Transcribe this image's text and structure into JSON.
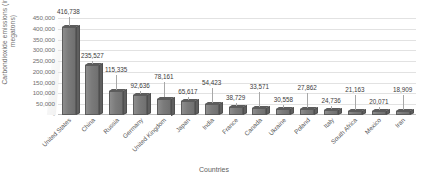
{
  "chart_data": {
    "type": "bar",
    "title": "",
    "xlabel": "Countries",
    "ylabel": "Carbondioxide emissions (in metric megatons)",
    "ylim": [
      0,
      450000
    ],
    "ytick_step": 50000,
    "grid": true,
    "legend": "none",
    "style": "3d-column",
    "bar_color": "#7b7b7b",
    "gridline_color": "#e2e2e2",
    "label_color": "#3c3c3c",
    "axis_text_color": "#6f6f6f",
    "background": "#ffffff",
    "categories": [
      "United States",
      "China",
      "Russia",
      "Germany",
      "United Kingdom",
      "Japan",
      "India",
      "France",
      "Canada",
      "Ukraine",
      "Poland",
      "Italy",
      "South Africa",
      "Mexico",
      "Iran"
    ],
    "values": [
      416738,
      235527,
      115335,
      92636,
      78161,
      65617,
      54423,
      38729,
      33571,
      30558,
      27862,
      24736,
      21163,
      20071,
      18909
    ],
    "value_labels": [
      "416,738",
      "235,527",
      "115,335",
      "92,636",
      "78,161",
      "65,617",
      "54,423",
      "38,729",
      "33,571",
      "30,558",
      "27,862",
      "24,736",
      "21,163",
      "20,071",
      "18,909"
    ],
    "ytick_labels": [
      "450,000",
      "400,000",
      "350,000",
      "300,000",
      "250,000",
      "200,000",
      "150,000",
      "100,000",
      "50,000",
      "-"
    ],
    "ytick_values": [
      450000,
      400000,
      350000,
      300000,
      250000,
      200000,
      150000,
      100000,
      50000,
      0
    ]
  }
}
